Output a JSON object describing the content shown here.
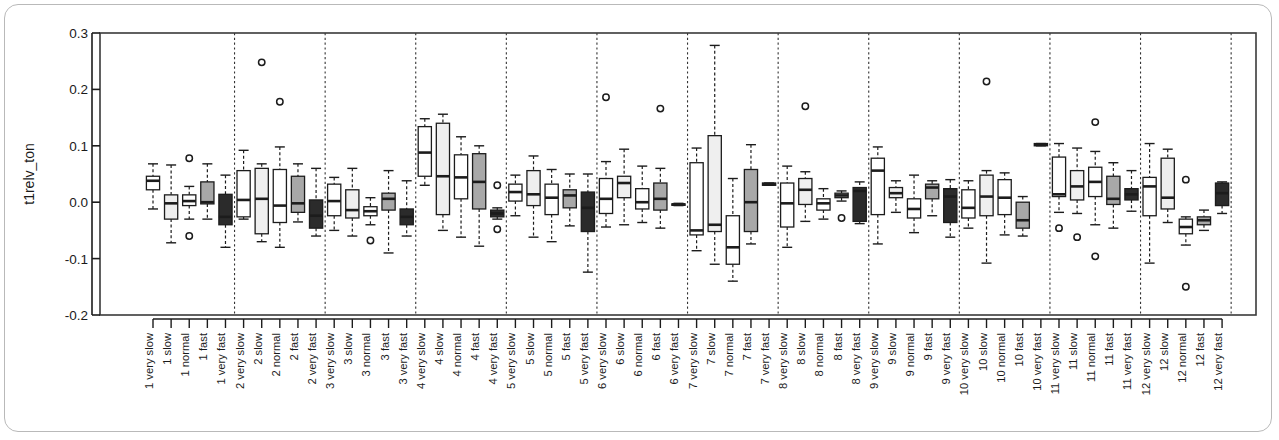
{
  "chart_data": {
    "type": "box",
    "title": "",
    "xlabel": "",
    "ylabel": "t1relv_ton",
    "ylim": [
      -0.2,
      0.3
    ],
    "yticks": [
      0.3,
      0.2,
      0.1,
      0.0,
      -0.1,
      -0.2
    ],
    "ytick_labels": [
      "0.3",
      "0.2",
      "0.1",
      "0.0",
      "-0.1",
      "-0.2"
    ],
    "grid": false,
    "legend": "none",
    "group_separators": true,
    "speeds": [
      "very slow",
      "slow",
      "normal",
      "fast",
      "very fast"
    ],
    "groups": [
      "1",
      "2",
      "3",
      "4",
      "5",
      "6",
      "7",
      "8",
      "9",
      "10",
      "11",
      "12"
    ],
    "fills": [
      "#ffffff",
      "#efefef",
      "#ffffff",
      "#a8a8a8",
      "#2b2b2b"
    ],
    "categories": [
      "1 very slow",
      "1 slow",
      "1 normal",
      "1 fast",
      "1 very fast",
      "2 very slow",
      "2 slow",
      "2 normal",
      "2 fast",
      "2 very fast",
      "3 very slow",
      "3 slow",
      "3 normal",
      "3 fast",
      "3 very fast",
      "4 very slow",
      "4 slow",
      "4 normal",
      "4 fast",
      "4 very fast",
      "5 very slow",
      "5 slow",
      "5 normal",
      "5 fast",
      "5 very fast",
      "6 very slow",
      "6 slow",
      "6 normal",
      "6 fast",
      "6 very fast",
      "7 very slow",
      "7 slow",
      "7 normal",
      "7 fast",
      "7 very fast",
      "8 very slow",
      "8 slow",
      "8 normal",
      "8 fast",
      "8 very fast",
      "9 very slow",
      "9 slow",
      "9 normal",
      "9 fast",
      "9 very fast",
      "10 very slow",
      "10 slow",
      "10 normal",
      "10 fast",
      "10 very fast",
      "11 very slow",
      "11 slow",
      "11 normal",
      "11 fast",
      "11 very fast",
      "12 very slow",
      "12 slow",
      "12 normal",
      "12 fast",
      "12 very fast"
    ],
    "boxes": [
      {
        "cat": "1 very slow",
        "whisker_low": -0.012,
        "q1": 0.022,
        "median": 0.038,
        "q3": 0.046,
        "whisker_high": 0.068,
        "outliers": [],
        "fill": "#ffffff"
      },
      {
        "cat": "1 slow",
        "whisker_low": -0.072,
        "q1": -0.03,
        "median": -0.002,
        "q3": 0.013,
        "whisker_high": 0.066,
        "outliers": [],
        "fill": "#efefef"
      },
      {
        "cat": "1 normal",
        "whisker_low": -0.03,
        "q1": -0.006,
        "median": 0.002,
        "q3": 0.013,
        "whisker_high": 0.028,
        "outliers": [
          0.078,
          -0.06
        ],
        "fill": "#ffffff"
      },
      {
        "cat": "1 fast",
        "whisker_low": -0.03,
        "q1": -0.003,
        "median": 0.0,
        "q3": 0.036,
        "whisker_high": 0.068,
        "outliers": [],
        "fill": "#a8a8a8"
      },
      {
        "cat": "1 very fast",
        "whisker_low": -0.08,
        "q1": -0.04,
        "median": -0.026,
        "q3": 0.014,
        "whisker_high": 0.048,
        "outliers": [],
        "fill": "#2b2b2b"
      },
      {
        "cat": "2 very slow",
        "whisker_low": -0.03,
        "q1": -0.026,
        "median": 0.004,
        "q3": 0.056,
        "whisker_high": 0.092,
        "outliers": [],
        "fill": "#ffffff"
      },
      {
        "cat": "2 slow",
        "whisker_low": -0.07,
        "q1": -0.056,
        "median": 0.006,
        "q3": 0.06,
        "whisker_high": 0.068,
        "outliers": [
          0.248
        ],
        "fill": "#efefef"
      },
      {
        "cat": "2 normal",
        "whisker_low": -0.08,
        "q1": -0.036,
        "median": -0.006,
        "q3": 0.058,
        "whisker_high": 0.098,
        "outliers": [
          0.178
        ],
        "fill": "#ffffff"
      },
      {
        "cat": "2 fast",
        "whisker_low": -0.035,
        "q1": -0.018,
        "median": -0.002,
        "q3": 0.046,
        "whisker_high": 0.068,
        "outliers": [],
        "fill": "#a8a8a8"
      },
      {
        "cat": "2 very fast",
        "whisker_low": -0.06,
        "q1": -0.046,
        "median": -0.024,
        "q3": 0.004,
        "whisker_high": 0.06,
        "outliers": [],
        "fill": "#2b2b2b"
      },
      {
        "cat": "3 very slow",
        "whisker_low": -0.05,
        "q1": -0.024,
        "median": 0.002,
        "q3": 0.032,
        "whisker_high": 0.044,
        "outliers": [],
        "fill": "#ffffff"
      },
      {
        "cat": "3 slow",
        "whisker_low": -0.06,
        "q1": -0.028,
        "median": -0.014,
        "q3": 0.022,
        "whisker_high": 0.06,
        "outliers": [],
        "fill": "#efefef"
      },
      {
        "cat": "3 normal",
        "whisker_low": -0.04,
        "q1": -0.024,
        "median": -0.016,
        "q3": -0.008,
        "whisker_high": 0.008,
        "outliers": [
          -0.068
        ],
        "fill": "#ffffff"
      },
      {
        "cat": "3 fast",
        "whisker_low": -0.09,
        "q1": -0.014,
        "median": 0.006,
        "q3": 0.016,
        "whisker_high": 0.056,
        "outliers": [],
        "fill": "#a8a8a8"
      },
      {
        "cat": "3 very fast",
        "whisker_low": -0.06,
        "q1": -0.04,
        "median": -0.026,
        "q3": -0.012,
        "whisker_high": 0.038,
        "outliers": [],
        "fill": "#2b2b2b"
      },
      {
        "cat": "4 very slow",
        "whisker_low": 0.03,
        "q1": 0.046,
        "median": 0.088,
        "q3": 0.134,
        "whisker_high": 0.148,
        "outliers": [],
        "fill": "#ffffff"
      },
      {
        "cat": "4 slow",
        "whisker_low": -0.05,
        "q1": -0.022,
        "median": 0.046,
        "q3": 0.14,
        "whisker_high": 0.156,
        "outliers": [],
        "fill": "#efefef"
      },
      {
        "cat": "4 normal",
        "whisker_low": -0.062,
        "q1": 0.006,
        "median": 0.044,
        "q3": 0.084,
        "whisker_high": 0.116,
        "outliers": [],
        "fill": "#ffffff"
      },
      {
        "cat": "4 fast",
        "whisker_low": -0.078,
        "q1": -0.012,
        "median": 0.036,
        "q3": 0.086,
        "whisker_high": 0.1,
        "outliers": [],
        "fill": "#a8a8a8"
      },
      {
        "cat": "4 very fast",
        "whisker_low": -0.03,
        "q1": -0.026,
        "median": -0.02,
        "q3": -0.014,
        "whisker_high": -0.01,
        "outliers": [
          0.03,
          -0.048
        ],
        "fill": "#2b2b2b"
      },
      {
        "cat": "5 very slow",
        "whisker_low": -0.024,
        "q1": 0.002,
        "median": 0.018,
        "q3": 0.032,
        "whisker_high": 0.048,
        "outliers": [],
        "fill": "#ffffff"
      },
      {
        "cat": "5 slow",
        "whisker_low": -0.062,
        "q1": -0.006,
        "median": 0.014,
        "q3": 0.056,
        "whisker_high": 0.082,
        "outliers": [],
        "fill": "#efefef"
      },
      {
        "cat": "5 normal",
        "whisker_low": -0.07,
        "q1": -0.022,
        "median": 0.008,
        "q3": 0.032,
        "whisker_high": 0.058,
        "outliers": [],
        "fill": "#ffffff"
      },
      {
        "cat": "5 fast",
        "whisker_low": -0.042,
        "q1": -0.01,
        "median": 0.012,
        "q3": 0.022,
        "whisker_high": 0.05,
        "outliers": [],
        "fill": "#a8a8a8"
      },
      {
        "cat": "5 very fast",
        "whisker_low": -0.124,
        "q1": -0.052,
        "median": -0.01,
        "q3": 0.018,
        "whisker_high": 0.05,
        "outliers": [],
        "fill": "#2b2b2b"
      },
      {
        "cat": "6 very slow",
        "whisker_low": -0.044,
        "q1": -0.02,
        "median": 0.006,
        "q3": 0.042,
        "whisker_high": 0.072,
        "outliers": [
          0.186
        ],
        "fill": "#ffffff"
      },
      {
        "cat": "6 slow",
        "whisker_low": -0.04,
        "q1": 0.008,
        "median": 0.034,
        "q3": 0.046,
        "whisker_high": 0.094,
        "outliers": [],
        "fill": "#efefef"
      },
      {
        "cat": "6 normal",
        "whisker_low": -0.036,
        "q1": -0.012,
        "median": 0.0,
        "q3": 0.024,
        "whisker_high": 0.064,
        "outliers": [],
        "fill": "#ffffff"
      },
      {
        "cat": "6 fast",
        "whisker_low": -0.046,
        "q1": -0.014,
        "median": 0.006,
        "q3": 0.034,
        "whisker_high": 0.06,
        "outliers": [
          0.166
        ],
        "fill": "#a8a8a8"
      },
      {
        "cat": "6 very fast",
        "whisker_low": -0.006,
        "q1": -0.005,
        "median": -0.004,
        "q3": -0.003,
        "whisker_high": -0.002,
        "outliers": [],
        "fill": "#2b2b2b"
      },
      {
        "cat": "7 very slow",
        "whisker_low": -0.086,
        "q1": -0.058,
        "median": -0.05,
        "q3": 0.07,
        "whisker_high": 0.096,
        "outliers": [],
        "fill": "#ffffff"
      },
      {
        "cat": "7 slow",
        "whisker_low": -0.11,
        "q1": -0.052,
        "median": -0.04,
        "q3": 0.118,
        "whisker_high": 0.278,
        "outliers": [],
        "fill": "#efefef"
      },
      {
        "cat": "7 normal",
        "whisker_low": -0.14,
        "q1": -0.11,
        "median": -0.08,
        "q3": -0.024,
        "whisker_high": 0.042,
        "outliers": [],
        "fill": "#ffffff"
      },
      {
        "cat": "7 fast",
        "whisker_low": -0.074,
        "q1": -0.052,
        "median": 0.0,
        "q3": 0.058,
        "whisker_high": 0.102,
        "outliers": [],
        "fill": "#a8a8a8"
      },
      {
        "cat": "7 very fast",
        "whisker_low": 0.03,
        "q1": 0.03,
        "median": 0.032,
        "q3": 0.034,
        "whisker_high": 0.034,
        "outliers": [],
        "fill": "#2b2b2b"
      },
      {
        "cat": "8 very slow",
        "whisker_low": -0.08,
        "q1": -0.044,
        "median": -0.002,
        "q3": 0.034,
        "whisker_high": 0.064,
        "outliers": [],
        "fill": "#ffffff"
      },
      {
        "cat": "8 slow",
        "whisker_low": -0.034,
        "q1": -0.004,
        "median": 0.022,
        "q3": 0.042,
        "whisker_high": 0.054,
        "outliers": [
          0.17
        ],
        "fill": "#efefef"
      },
      {
        "cat": "8 normal",
        "whisker_low": -0.03,
        "q1": -0.014,
        "median": -0.002,
        "q3": 0.006,
        "whisker_high": 0.024,
        "outliers": [],
        "fill": "#ffffff"
      },
      {
        "cat": "8 fast",
        "whisker_low": 0.002,
        "q1": 0.008,
        "median": 0.012,
        "q3": 0.016,
        "whisker_high": 0.02,
        "outliers": [
          -0.028
        ],
        "fill": "#a8a8a8"
      },
      {
        "cat": "8 very fast",
        "whisker_low": -0.038,
        "q1": -0.034,
        "median": 0.02,
        "q3": 0.026,
        "whisker_high": 0.036,
        "outliers": [],
        "fill": "#2b2b2b"
      },
      {
        "cat": "9 very slow",
        "whisker_low": -0.074,
        "q1": -0.022,
        "median": 0.056,
        "q3": 0.078,
        "whisker_high": 0.098,
        "outliers": [],
        "fill": "#ffffff"
      },
      {
        "cat": "9 slow",
        "whisker_low": -0.018,
        "q1": 0.008,
        "median": 0.016,
        "q3": 0.026,
        "whisker_high": 0.038,
        "outliers": [],
        "fill": "#efefef"
      },
      {
        "cat": "9 normal",
        "whisker_low": -0.054,
        "q1": -0.028,
        "median": -0.012,
        "q3": 0.006,
        "whisker_high": 0.048,
        "outliers": [],
        "fill": "#ffffff"
      },
      {
        "cat": "9 fast",
        "whisker_low": -0.024,
        "q1": 0.006,
        "median": 0.026,
        "q3": 0.032,
        "whisker_high": 0.038,
        "outliers": [],
        "fill": "#a8a8a8"
      },
      {
        "cat": "9 very fast",
        "whisker_low": -0.062,
        "q1": -0.036,
        "median": 0.01,
        "q3": 0.024,
        "whisker_high": 0.04,
        "outliers": [],
        "fill": "#2b2b2b"
      },
      {
        "cat": "10 very slow",
        "whisker_low": -0.046,
        "q1": -0.028,
        "median": -0.01,
        "q3": 0.022,
        "whisker_high": 0.038,
        "outliers": [],
        "fill": "#ffffff"
      },
      {
        "cat": "10 slow",
        "whisker_low": -0.108,
        "q1": -0.024,
        "median": 0.01,
        "q3": 0.048,
        "whisker_high": 0.056,
        "outliers": [
          0.214
        ],
        "fill": "#efefef"
      },
      {
        "cat": "10 normal",
        "whisker_low": -0.058,
        "q1": -0.022,
        "median": 0.008,
        "q3": 0.04,
        "whisker_high": 0.052,
        "outliers": [],
        "fill": "#ffffff"
      },
      {
        "cat": "10 fast",
        "whisker_low": -0.06,
        "q1": -0.046,
        "median": -0.032,
        "q3": 0.0,
        "whisker_high": 0.01,
        "outliers": [],
        "fill": "#a8a8a8"
      },
      {
        "cat": "10 very fast",
        "whisker_low": 0.1,
        "q1": 0.1,
        "median": 0.102,
        "q3": 0.104,
        "whisker_high": 0.104,
        "outliers": [],
        "fill": "#2b2b2b"
      },
      {
        "cat": "11 very slow",
        "whisker_low": -0.018,
        "q1": 0.01,
        "median": 0.014,
        "q3": 0.08,
        "whisker_high": 0.104,
        "outliers": [
          -0.046
        ],
        "fill": "#ffffff"
      },
      {
        "cat": "11 slow",
        "whisker_low": -0.02,
        "q1": 0.004,
        "median": 0.028,
        "q3": 0.056,
        "whisker_high": 0.096,
        "outliers": [
          -0.062
        ],
        "fill": "#efefef"
      },
      {
        "cat": "11 normal",
        "whisker_low": -0.04,
        "q1": 0.01,
        "median": 0.036,
        "q3": 0.062,
        "whisker_high": 0.09,
        "outliers": [
          0.142,
          -0.096
        ],
        "fill": "#ffffff"
      },
      {
        "cat": "11 fast",
        "whisker_low": -0.046,
        "q1": -0.004,
        "median": 0.006,
        "q3": 0.046,
        "whisker_high": 0.07,
        "outliers": [],
        "fill": "#a8a8a8"
      },
      {
        "cat": "11 very fast",
        "whisker_low": -0.016,
        "q1": 0.004,
        "median": 0.014,
        "q3": 0.024,
        "whisker_high": 0.056,
        "outliers": [],
        "fill": "#2b2b2b"
      },
      {
        "cat": "12 very slow",
        "whisker_low": -0.108,
        "q1": -0.024,
        "median": 0.028,
        "q3": 0.044,
        "whisker_high": 0.104,
        "outliers": [],
        "fill": "#ffffff"
      },
      {
        "cat": "12 slow",
        "whisker_low": -0.036,
        "q1": -0.012,
        "median": 0.008,
        "q3": 0.078,
        "whisker_high": 0.094,
        "outliers": [],
        "fill": "#efefef"
      },
      {
        "cat": "12 normal",
        "whisker_low": -0.076,
        "q1": -0.056,
        "median": -0.044,
        "q3": -0.03,
        "whisker_high": -0.026,
        "outliers": [
          0.04,
          -0.15
        ],
        "fill": "#ffffff"
      },
      {
        "cat": "12 fast",
        "whisker_low": -0.05,
        "q1": -0.04,
        "median": -0.032,
        "q3": -0.026,
        "whisker_high": -0.014,
        "outliers": [],
        "fill": "#a8a8a8"
      },
      {
        "cat": "12 very fast",
        "whisker_low": -0.02,
        "q1": -0.006,
        "median": 0.016,
        "q3": 0.034,
        "whisker_high": 0.036,
        "outliers": [],
        "fill": "#2b2b2b"
      }
    ]
  },
  "axis": {
    "y_label": "t1relv_ton"
  }
}
